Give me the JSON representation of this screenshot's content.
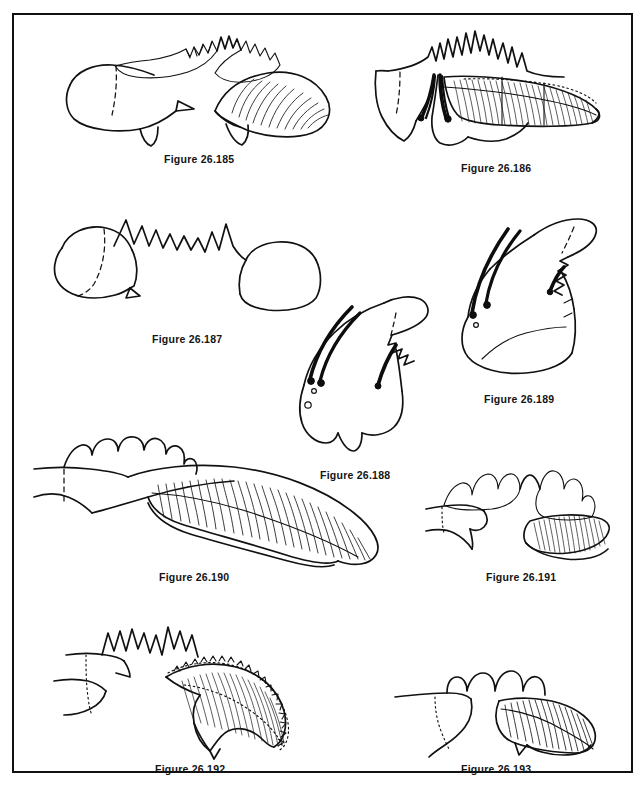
{
  "plate": {
    "background_color": "#ffffff",
    "border_color": "#111111",
    "ink_color": "#111111",
    "figure_count": 9
  },
  "figures": [
    {
      "id": "fig-26-185",
      "caption": "Figure 26.185",
      "caption_x": 150,
      "caption_y": 138
    },
    {
      "id": "fig-26-186",
      "caption": "Figure 26.186",
      "caption_x": 447,
      "caption_y": 147
    },
    {
      "id": "fig-26-187",
      "caption": "Figure 26.187",
      "caption_x": 138,
      "caption_y": 318
    },
    {
      "id": "fig-26-188",
      "caption": "Figure 26.188",
      "caption_x": 306,
      "caption_y": 454
    },
    {
      "id": "fig-26-189",
      "caption": "Figure 26.189",
      "caption_x": 470,
      "caption_y": 378
    },
    {
      "id": "fig-26-190",
      "caption": "Figure 26.190",
      "caption_x": 145,
      "caption_y": 556
    },
    {
      "id": "fig-26-191",
      "caption": "Figure 26.191",
      "caption_x": 472,
      "caption_y": 556
    },
    {
      "id": "fig-26-192",
      "caption": "Figure 26.192",
      "caption_x": 141,
      "caption_y": 748
    },
    {
      "id": "fig-26-193",
      "caption": "Figure 26.193",
      "caption_x": 447,
      "caption_y": 748
    }
  ]
}
